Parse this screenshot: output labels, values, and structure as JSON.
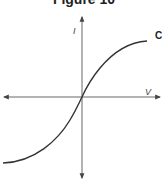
{
  "figure": {
    "title": "Figure 10",
    "y_axis_label": "I",
    "x_axis_label": "V",
    "curve_label": "C"
  },
  "colors": {
    "axis": "#555555",
    "curve": "#333333"
  }
}
